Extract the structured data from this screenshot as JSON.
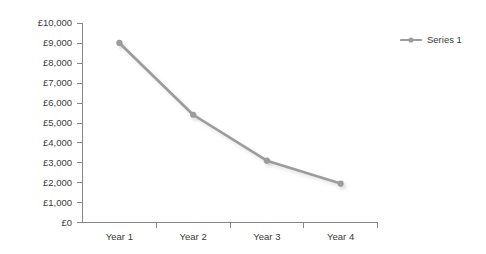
{
  "chart_data": {
    "type": "line",
    "title": "",
    "subtitle": "",
    "xlabel": "",
    "ylabel": "",
    "categories": [
      "Year 1",
      "Year 2",
      "Year 3",
      "Year 4"
    ],
    "series": [
      {
        "name": "Series 1",
        "values": [
          9000,
          5400,
          3100,
          1950
        ],
        "color": "#9c9c9c",
        "marker": "circle"
      }
    ],
    "ylim": [
      0,
      10000
    ],
    "ytick_values": [
      0,
      1000,
      2000,
      3000,
      4000,
      5000,
      6000,
      7000,
      8000,
      9000,
      10000
    ],
    "ytick_labels": [
      "£0",
      "£1,000",
      "£2,000",
      "£3,000",
      "£4,000",
      "£5,000",
      "£6,000",
      "£7,000",
      "£8,000",
      "£9,000",
      "£10,000"
    ],
    "currency_symbol": "£",
    "grid": false,
    "legend_position": "right",
    "plot_background": "#ffffff",
    "axis_color": "#868686",
    "text_color": "#3a3a3a"
  },
  "legend": {
    "entries": [
      {
        "label": "Series 1",
        "color": "#9c9c9c"
      }
    ]
  },
  "axes": {
    "y": {
      "labels": [
        "£10,000",
        "£9,000",
        "£8,000",
        "£7,000",
        "£6,000",
        "£5,000",
        "£4,000",
        "£3,000",
        "£2,000",
        "£1,000",
        "£0"
      ]
    },
    "x": {
      "labels": [
        "Year 1",
        "Year 2",
        "Year 3",
        "Year 4"
      ]
    }
  }
}
